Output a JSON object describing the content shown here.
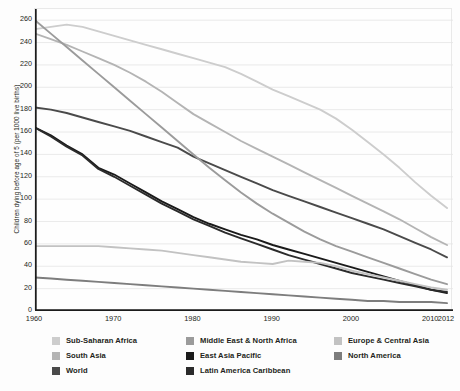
{
  "chart_data": {
    "type": "line",
    "title": "",
    "xlabel": "",
    "ylabel": "Children dying before age of 5 (per 1000 live births)",
    "xlim": [
      1960,
      2012
    ],
    "ylim": [
      0,
      270
    ],
    "grid": true,
    "legend_position": "bottom",
    "yticks": [
      0,
      20,
      40,
      60,
      80,
      100,
      120,
      140,
      160,
      180,
      200,
      220,
      240,
      260
    ],
    "xticks": [
      1960,
      1970,
      1980,
      1990,
      2000,
      2010,
      2012
    ],
    "xtick_labels": [
      "1960",
      "1970",
      "1980",
      "1990",
      "2000",
      "2010",
      "2012"
    ],
    "x": [
      1960,
      1962,
      1964,
      1966,
      1968,
      1970,
      1972,
      1974,
      1976,
      1978,
      1980,
      1982,
      1984,
      1986,
      1988,
      1990,
      1992,
      1994,
      1996,
      1998,
      2000,
      2002,
      2004,
      2006,
      2008,
      2010,
      2012
    ],
    "series": [
      {
        "name": "Sub-Saharan Africa",
        "color": "#cdcdcd",
        "values": [
          252,
          254,
          256,
          254,
          250,
          246,
          242,
          238,
          234,
          230,
          226,
          222,
          218,
          212,
          205,
          198,
          192,
          186,
          180,
          172,
          162,
          151,
          140,
          128,
          115,
          103,
          92
        ]
      },
      {
        "name": "South Asia",
        "color": "#b4b4b4",
        "values": [
          248,
          243,
          238,
          232,
          226,
          220,
          213,
          205,
          196,
          186,
          176,
          168,
          160,
          152,
          145,
          138,
          131,
          124,
          117,
          110,
          103,
          96,
          89,
          82,
          74,
          66,
          59
        ]
      },
      {
        "name": "World",
        "color": "#4a4a4a",
        "values": [
          182,
          180,
          177,
          173,
          169,
          165,
          161,
          156,
          151,
          146,
          138,
          132,
          126,
          120,
          114,
          108,
          103,
          98,
          93,
          88,
          83,
          78,
          73,
          67,
          61,
          55,
          48
        ]
      },
      {
        "name": "Middle East & North Africa",
        "color": "#9b9b9b",
        "values": [
          260,
          248,
          236,
          224,
          212,
          200,
          188,
          176,
          164,
          152,
          140,
          128,
          117,
          106,
          96,
          87,
          79,
          71,
          64,
          58,
          53,
          48,
          43,
          38,
          33,
          28,
          24
        ]
      },
      {
        "name": "East Asia Pacific",
        "color": "#1a1a1a",
        "values": [
          164,
          157,
          148,
          140,
          128,
          122,
          114,
          106,
          98,
          91,
          84,
          78,
          73,
          68,
          64,
          59,
          55,
          51,
          47,
          43,
          39,
          35,
          31,
          27,
          23,
          19,
          16
        ]
      },
      {
        "name": "Latin America Caribbean",
        "color": "#2b2b2b",
        "values": [
          164,
          156,
          147,
          139,
          127,
          120,
          112,
          104,
          96,
          89,
          82,
          76,
          70,
          65,
          60,
          55,
          50,
          46,
          42,
          38,
          34,
          31,
          28,
          25,
          22,
          19,
          17
        ]
      },
      {
        "name": "Europe & Central Asia",
        "color": "#c2c2c2",
        "values": [
          58,
          58,
          58,
          58,
          58,
          57,
          56,
          55,
          54,
          52,
          50,
          48,
          46,
          44,
          43,
          42,
          45,
          44,
          43,
          40,
          36,
          33,
          30,
          27,
          24,
          21,
          19
        ]
      },
      {
        "name": "North America",
        "color": "#7d7d7d",
        "values": [
          30,
          29,
          28,
          27,
          26,
          25,
          24,
          23,
          22,
          21,
          20,
          19,
          18,
          17,
          16,
          15,
          14,
          13,
          12,
          11,
          10,
          9,
          9,
          8,
          8,
          8,
          7
        ]
      }
    ]
  },
  "legend": {
    "columns": [
      {
        "items": [
          {
            "label": "Sub-Saharan Africa",
            "color": "#cdcdcd"
          },
          {
            "label": "South Asia",
            "color": "#b4b4b4"
          },
          {
            "label": "World",
            "color": "#4a4a4a"
          }
        ]
      },
      {
        "items": [
          {
            "label": "Middle East & North Africa",
            "color": "#9b9b9b"
          },
          {
            "label": "East Asia Pacific",
            "color": "#1a1a1a"
          },
          {
            "label": "Latin America Caribbean",
            "color": "#2b2b2b"
          }
        ]
      },
      {
        "items": [
          {
            "label": "Europe & Central Asia",
            "color": "#c2c2c2"
          },
          {
            "label": "North America",
            "color": "#7d7d7d"
          }
        ]
      }
    ]
  },
  "style": {
    "grid_color": "#e4e4e4",
    "axis_color": "#1c1c1c",
    "frame_color": "#ececec",
    "background": "#fdfdfd",
    "text_color": "#231f20"
  }
}
